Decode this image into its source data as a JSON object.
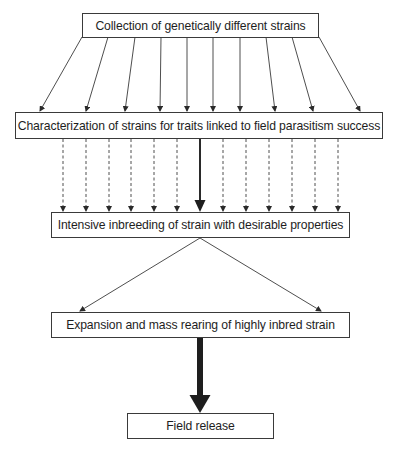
{
  "diagram": {
    "type": "flowchart",
    "colors": {
      "line": "#3a3a3a",
      "text": "#1e1e1e",
      "background": "#ffffff"
    },
    "nodes": [
      {
        "id": "collection",
        "label": "Collection of genetically different strains"
      },
      {
        "id": "characterization",
        "label": "Characterization of strains for traits linked to field parasitism success"
      },
      {
        "id": "inbreeding",
        "label": "Intensive inbreeding of strain with desirable properties"
      },
      {
        "id": "expansion",
        "label": "Expansion and mass rearing of highly inbred strain"
      },
      {
        "id": "release",
        "label": "Field release"
      }
    ],
    "edges": [
      {
        "from": "collection",
        "to": "characterization",
        "style": "solid-thin",
        "count": 10
      },
      {
        "from": "characterization",
        "to": "inbreeding",
        "style": "dashed-thin",
        "count": 12
      },
      {
        "from": "characterization",
        "to": "inbreeding",
        "style": "solid-medium",
        "count": 1
      },
      {
        "from": "inbreeding",
        "to": "expansion",
        "style": "solid-thin-diverging",
        "count": 2
      },
      {
        "from": "expansion",
        "to": "release",
        "style": "solid-thick",
        "count": 1
      }
    ]
  }
}
